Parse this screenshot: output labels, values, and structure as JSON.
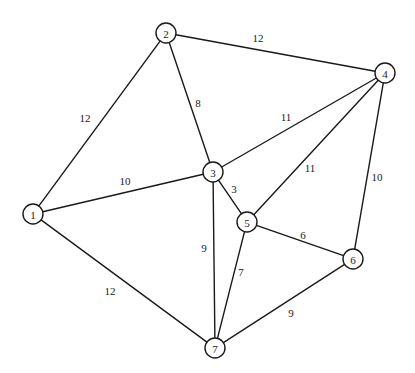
{
  "diagram": {
    "type": "weighted-undirected-graph",
    "title": "",
    "background_color": "#ffffff",
    "stroke_color": "#1a1a1a",
    "node_fill_color": "#ffffff",
    "node_radius": 10,
    "canvas": {
      "width": 415,
      "height": 373
    },
    "nodes": [
      {
        "id": "1",
        "label": "1",
        "x": 33,
        "y": 214
      },
      {
        "id": "2",
        "label": "2",
        "x": 166,
        "y": 33
      },
      {
        "id": "3",
        "label": "3",
        "x": 213,
        "y": 172
      },
      {
        "id": "4",
        "label": "4",
        "x": 385,
        "y": 73
      },
      {
        "id": "5",
        "label": "5",
        "x": 247,
        "y": 222
      },
      {
        "id": "6",
        "label": "6",
        "x": 353,
        "y": 259
      },
      {
        "id": "7",
        "label": "7",
        "x": 215,
        "y": 348
      }
    ],
    "edges": [
      {
        "from": "1",
        "to": "2",
        "weight": "12",
        "lx": 85,
        "ly": 118
      },
      {
        "from": "1",
        "to": "3",
        "weight": "10",
        "lx": 125,
        "ly": 181
      },
      {
        "from": "1",
        "to": "7",
        "weight": "12",
        "lx": 110,
        "ly": 291
      },
      {
        "from": "2",
        "to": "3",
        "weight": "8",
        "lx": 198,
        "ly": 103
      },
      {
        "from": "2",
        "to": "4",
        "weight": "12",
        "lx": 258,
        "ly": 38
      },
      {
        "from": "3",
        "to": "4",
        "weight": "11",
        "lx": 286,
        "ly": 117
      },
      {
        "from": "3",
        "to": "5",
        "weight": "3",
        "lx": 234,
        "ly": 189
      },
      {
        "from": "3",
        "to": "7",
        "weight": "9",
        "lx": 204,
        "ly": 248
      },
      {
        "from": "4",
        "to": "5",
        "weight": "11",
        "lx": 310,
        "ly": 168
      },
      {
        "from": "4",
        "to": "6",
        "weight": "10",
        "lx": 377,
        "ly": 177
      },
      {
        "from": "5",
        "to": "6",
        "weight": "6",
        "lx": 303,
        "ly": 235
      },
      {
        "from": "5",
        "to": "7",
        "weight": "7",
        "lx": 241,
        "ly": 272
      },
      {
        "from": "6",
        "to": "7",
        "weight": "9",
        "lx": 291,
        "ly": 313
      }
    ]
  }
}
